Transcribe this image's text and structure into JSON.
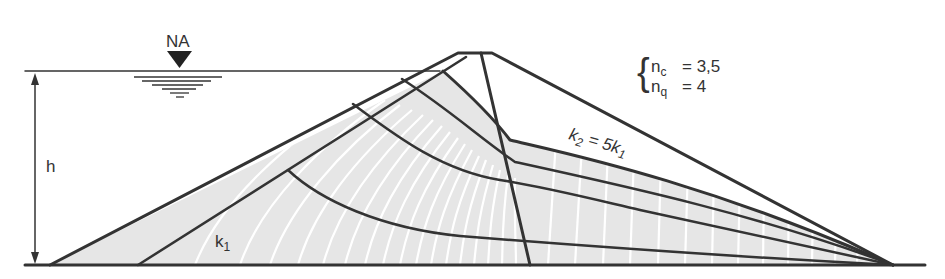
{
  "diagram": {
    "type": "earth-dam-flow-net",
    "labels": {
      "water_level": "NA",
      "height": "h",
      "zone1_perm": "k",
      "zone1_perm_sub": "1",
      "zone2_perm_prefix": "k",
      "zone2_perm_sub": "2",
      "zone2_perm_eq": " = 5k",
      "zone2_perm_eq_sub": "1"
    },
    "flow_net": {
      "nc_label": "n",
      "nc_sub": "c",
      "nc_value": "=  3,5",
      "nq_label": "n",
      "nq_sub": "q",
      "nq_value": "=  4"
    },
    "colors": {
      "line": "#333333",
      "fill": "#e6e6e6",
      "equipotential": "#ffffff",
      "background": "#ffffff"
    }
  }
}
